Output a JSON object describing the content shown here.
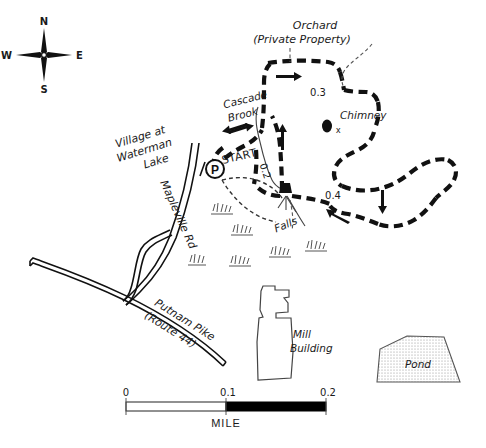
{
  "map": {
    "title": "Cascade Brook Trail Map",
    "background_color": "#ffffff",
    "ink_color": "#111111",
    "compass": {
      "north": "N",
      "south": "S",
      "east": "E",
      "west": "W"
    },
    "places": [
      {
        "name": "orchard",
        "line1": "Orchard",
        "line2": "(Private Property)"
      },
      {
        "name": "village",
        "line1": "Village at",
        "line2": "Waterman",
        "line3": "Lake"
      }
    ],
    "features": [
      {
        "name": "cascade-brook",
        "line1": "Cascade",
        "line2": "Brook"
      },
      {
        "name": "chimney",
        "label": "Chimney",
        "marker": "x"
      },
      {
        "name": "falls",
        "label": "Falls"
      },
      {
        "name": "mill-building",
        "line1": "Mill",
        "line2": "Building"
      },
      {
        "name": "pond",
        "label": "Pond"
      }
    ],
    "roads": [
      {
        "name": "mapleville-road",
        "label": "Mapleville Rd"
      },
      {
        "name": "putnam-pike",
        "line1": "Putnam Pike",
        "line2": "(Route 44)"
      }
    ],
    "trail": {
      "start_label": "START",
      "parking_symbol": "P",
      "distance_markers": [
        "0.2",
        "0.3",
        "0.4"
      ]
    },
    "scale_bar": {
      "ticks": [
        "0",
        "0.1",
        "0.2"
      ],
      "unit": "MILE",
      "fill_left": "#ffffff",
      "fill_right": "#000000"
    }
  }
}
